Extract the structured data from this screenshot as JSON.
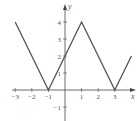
{
  "chart_data": {
    "type": "line",
    "title": "",
    "xlabel": "x",
    "ylabel": "y",
    "xlim": [
      -3.3,
      4.3
    ],
    "ylim": [
      -1.8,
      4.5
    ],
    "grid": false,
    "legend": null,
    "x_ticks": [
      -3,
      -2,
      -1,
      1,
      2,
      3
    ],
    "y_ticks": [
      -1,
      1,
      2,
      3,
      4
    ],
    "x_tick_labels": [
      "−3",
      "−2",
      "−1",
      "1",
      "2",
      "3"
    ],
    "y_tick_labels": [
      "−1",
      "1",
      "2",
      "3",
      "4"
    ],
    "series": [
      {
        "name": "f(x)",
        "x": [
          -3,
          -1,
          1,
          3,
          4
        ],
        "y": [
          4,
          0,
          4,
          0,
          2
        ]
      }
    ],
    "line_color": "#555555",
    "axis_color": "#444444"
  }
}
